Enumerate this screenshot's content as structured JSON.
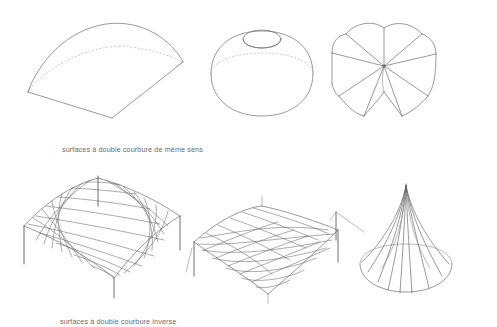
{
  "document": {
    "title": "surfaces à double courbure",
    "language": "fr",
    "background_color": "#ffffff",
    "line_color": "#6e6e6e",
    "hidden_line_color": "#9b9b9b",
    "mesh_line_color": "#5f5f5f",
    "caption_color": "#6b6b6b",
    "width": 497,
    "height": 327
  },
  "rows": [
    {
      "id": "row-same-sense",
      "caption": "surfaces à double courbure de même sens",
      "figures": [
        {
          "id": "fig-vault-shallow",
          "name": "shallow-square-dome",
          "description": "voile quadrangulaire bombé à courbure de même sens",
          "hidden_edges": true
        },
        {
          "id": "fig-dome-oculus",
          "name": "dome-with-oculus",
          "description": "coupole de révolution percée d'un oculus",
          "hidden_edges": true
        },
        {
          "id": "fig-umbrella-vault",
          "name": "umbrella-vault",
          "description": "voûte en parapluie à arcs rayonnants",
          "hidden_edges": false
        }
      ]
    },
    {
      "id": "row-inverse-sense",
      "caption": "surfaces à double courbure inverse",
      "figures": [
        {
          "id": "fig-hypar-membrane",
          "name": "hyperbolic-paraboloid-membrane",
          "description": "membrane en paraboloïde hyperbolique sur mât central",
          "mesh": true
        },
        {
          "id": "fig-saddle-membrane",
          "name": "saddle-membrane-four-points",
          "description": "membrane en selle de cheval à quatre points d'ancrage",
          "mesh": true
        },
        {
          "id": "fig-conical-tent",
          "name": "conical-tent-hyperboloid",
          "description": "tente conique à génératrices rayonnantes",
          "mesh": false
        }
      ]
    }
  ]
}
